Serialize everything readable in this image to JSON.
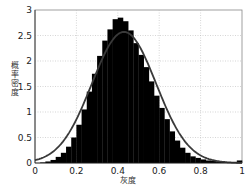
{
  "chart_data": {
    "type": "bar",
    "title": "",
    "xlabel": "灰度",
    "ylabel": "概率密度",
    "xlim": [
      0,
      1
    ],
    "ylim": [
      0,
      3
    ],
    "grid": true,
    "legend": null,
    "x_ticks": [
      "0",
      "0.2",
      "0.4",
      "0.6",
      "0.8",
      "1"
    ],
    "y_ticks": [
      "0",
      "0.5",
      "1",
      "1.5",
      "2",
      "2.5",
      "3"
    ],
    "bin_width": 0.025,
    "bin_starts": [
      0.0,
      0.025,
      0.05,
      0.075,
      0.1,
      0.125,
      0.15,
      0.175,
      0.2,
      0.225,
      0.25,
      0.275,
      0.3,
      0.325,
      0.35,
      0.375,
      0.4,
      0.425,
      0.45,
      0.475,
      0.5,
      0.525,
      0.55,
      0.575,
      0.6,
      0.625,
      0.65,
      0.675,
      0.7,
      0.725,
      0.75,
      0.775,
      0.8,
      0.825,
      0.85,
      0.875,
      0.9,
      0.925,
      0.95,
      0.975
    ],
    "series": [
      {
        "name": "histogram",
        "type": "bar",
        "color": "#000000",
        "values": [
          0.0,
          0.01,
          0.03,
          0.06,
          0.12,
          0.2,
          0.32,
          0.5,
          0.75,
          1.05,
          1.4,
          1.75,
          2.1,
          2.4,
          2.62,
          2.82,
          2.85,
          2.78,
          2.6,
          2.35,
          2.12,
          1.88,
          1.6,
          1.32,
          1.08,
          0.86,
          0.62,
          0.44,
          0.3,
          0.2,
          0.13,
          0.1,
          0.07,
          0.05,
          0.04,
          0.03,
          0.02,
          0.02,
          0.02,
          0.05
        ]
      },
      {
        "name": "normal fit",
        "type": "line",
        "color": "#3a3a3a",
        "mean": 0.43,
        "std": 0.155,
        "peak": 2.57
      }
    ]
  }
}
